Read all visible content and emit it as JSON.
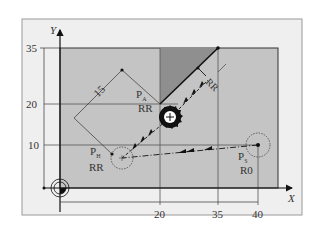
{
  "diagram": {
    "axes": {
      "x_label": "X",
      "y_label": "Y",
      "x_ticks": [
        "20",
        "35",
        "40"
      ],
      "y_ticks": [
        "35",
        "20",
        "10"
      ]
    },
    "dimension": {
      "length_label": "15"
    },
    "points": {
      "pa": {
        "name": "P",
        "sub": "A",
        "comp": "RR"
      },
      "ph": {
        "name": "P",
        "sub": "H",
        "comp": "RR"
      },
      "ps": {
        "name": "P",
        "sub": "S",
        "comp": "R0"
      }
    },
    "offset_label": "RR",
    "colors": {
      "frame_bg": "#efefef",
      "workpiece": "#c4c4c4",
      "dark_region": "#8f8f8f",
      "line": "#222222"
    }
  }
}
